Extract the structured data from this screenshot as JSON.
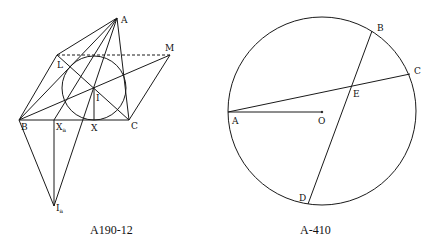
{
  "figures": [
    {
      "caption": "A190-12",
      "points": {
        "A": {
          "label": "A",
          "x": 117,
          "y": 18
        },
        "L": {
          "label": "L",
          "x": 57,
          "y": 55
        },
        "M": {
          "label": "M",
          "x": 170,
          "y": 55
        },
        "I": {
          "label": "I",
          "x": 94,
          "y": 87
        },
        "B": {
          "label": "B",
          "x": 19,
          "y": 120
        },
        "Xa": {
          "label": "X",
          "sub": "a",
          "x": 54,
          "y": 120
        },
        "X": {
          "label": "X",
          "x": 94,
          "y": 120
        },
        "C": {
          "label": "C",
          "x": 129,
          "y": 120
        },
        "Ia": {
          "label": "I",
          "sub": "a",
          "x": 54,
          "y": 206
        }
      },
      "incircle": {
        "cx": 94,
        "cy": 88,
        "r": 32
      }
    },
    {
      "caption": "A-410",
      "points": {
        "A": {
          "label": "A",
          "x": 228,
          "y": 112
        },
        "O": {
          "label": "O",
          "x": 322,
          "y": 112
        },
        "B": {
          "label": "B",
          "x": 372,
          "y": 31
        },
        "C": {
          "label": "C",
          "x": 410,
          "y": 74
        },
        "E": {
          "label": "E",
          "x": 351,
          "y": 87
        },
        "D": {
          "label": "D",
          "x": 308,
          "y": 204
        }
      },
      "circle": {
        "cx": 322,
        "cy": 111,
        "r": 94
      }
    }
  ]
}
